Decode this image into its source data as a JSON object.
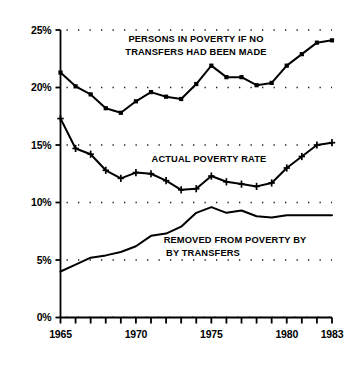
{
  "chart_data": {
    "type": "line",
    "title": "",
    "subtitle": "",
    "xlabel": "",
    "ylabel": "",
    "xlim": [
      1965,
      1983
    ],
    "ylim": [
      0,
      25
    ],
    "grid": true,
    "grid_style": "dotted-horizontal",
    "legend_position": "inline-annotations",
    "x": [
      1965,
      1966,
      1967,
      1968,
      1969,
      1970,
      1971,
      1972,
      1973,
      1974,
      1975,
      1976,
      1977,
      1978,
      1979,
      1980,
      1981,
      1982,
      1983
    ],
    "x_tick_labels": [
      "1965",
      "",
      "",
      "",
      "",
      "1970",
      "",
      "",
      "",
      "",
      "1975",
      "",
      "",
      "",
      "",
      "1980",
      "",
      "",
      "1983"
    ],
    "y_tick_values": [
      0,
      5,
      10,
      15,
      20,
      25
    ],
    "y_tick_labels": [
      "0%",
      "5%",
      "10%",
      "15%",
      "20%",
      "25%"
    ],
    "series": [
      {
        "name": "PERSONS IN POVERTY IF NO TRANSFERS HAD BEEN MADE",
        "marker": "square",
        "values": [
          21.3,
          20.1,
          19.4,
          18.2,
          17.8,
          18.8,
          19.6,
          19.2,
          19.0,
          20.3,
          21.9,
          20.9,
          20.9,
          20.2,
          20.4,
          21.9,
          22.9,
          23.9,
          24.1
        ]
      },
      {
        "name": "ACTUAL POVERTY RATE",
        "marker": "plus",
        "values": [
          17.3,
          14.7,
          14.2,
          12.8,
          12.1,
          12.6,
          12.5,
          11.9,
          11.1,
          11.2,
          12.3,
          11.8,
          11.6,
          11.4,
          11.7,
          13.0,
          14.0,
          15.0,
          15.2
        ]
      },
      {
        "name": "REMOVED FROM POVERTY BY BY TRANSFERS",
        "marker": "none",
        "values": [
          4.0,
          4.6,
          5.2,
          5.4,
          5.7,
          6.2,
          7.1,
          7.3,
          7.9,
          9.1,
          9.6,
          9.1,
          9.3,
          8.8,
          8.7,
          8.9,
          8.9,
          8.9,
          8.9
        ]
      }
    ],
    "annotations": [
      {
        "id": "annotation-no-transfers",
        "lines": [
          "PERSONS IN POVERTY IF NO",
          "TRANSFERS HAD BEEN MADE"
        ]
      },
      {
        "id": "annotation-actual-rate",
        "lines": [
          "ACTUAL POVERTY RATE"
        ]
      },
      {
        "id": "annotation-removed",
        "lines": [
          "REMOVED FROM POVERTY BY",
          "BY TRANSFERS"
        ]
      }
    ],
    "colors": {
      "line": "#000000",
      "axis": "#000000",
      "grid": "#1a1a1a",
      "background": "#ffffff",
      "text": "#000000"
    }
  }
}
